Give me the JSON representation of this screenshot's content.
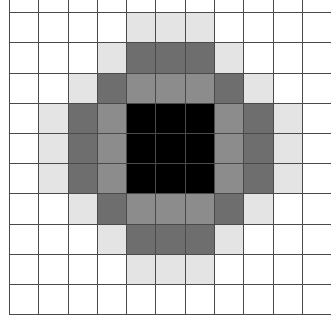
{
  "figure": {
    "rows": 11,
    "cols": 11,
    "palette": {
      "W": "#ffffff",
      "L": "#e4e4e4",
      "M": "#8c8c8c",
      "D": "#6e6e6e",
      "K": "#000000"
    },
    "grid_line_color": "#4a4a4a",
    "cells": [
      [
        "W",
        "W",
        "W",
        "W",
        "W",
        "W",
        "W",
        "W",
        "W",
        "W",
        "W"
      ],
      [
        "W",
        "W",
        "W",
        "W",
        "L",
        "L",
        "L",
        "W",
        "W",
        "W",
        "W"
      ],
      [
        "W",
        "W",
        "W",
        "L",
        "D",
        "D",
        "D",
        "L",
        "W",
        "W",
        "W"
      ],
      [
        "W",
        "W",
        "L",
        "D",
        "M",
        "M",
        "M",
        "D",
        "L",
        "W",
        "W"
      ],
      [
        "W",
        "L",
        "D",
        "M",
        "K",
        "K",
        "K",
        "M",
        "D",
        "L",
        "W"
      ],
      [
        "W",
        "L",
        "D",
        "M",
        "K",
        "K",
        "K",
        "M",
        "D",
        "L",
        "W"
      ],
      [
        "W",
        "L",
        "D",
        "M",
        "K",
        "K",
        "K",
        "M",
        "D",
        "L",
        "W"
      ],
      [
        "W",
        "W",
        "L",
        "D",
        "M",
        "M",
        "M",
        "D",
        "L",
        "W",
        "W"
      ],
      [
        "W",
        "W",
        "W",
        "L",
        "D",
        "D",
        "D",
        "L",
        "W",
        "W",
        "W"
      ],
      [
        "W",
        "W",
        "W",
        "W",
        "L",
        "L",
        "L",
        "W",
        "W",
        "W",
        "W"
      ],
      [
        "W",
        "W",
        "W",
        "W",
        "W",
        "W",
        "W",
        "W",
        "W",
        "W",
        "W"
      ]
    ]
  }
}
